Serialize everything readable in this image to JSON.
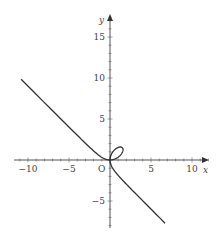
{
  "chart_data": {
    "type": "line",
    "title": "",
    "equation": "x^3 + y^3 = 3xy",
    "parameter_a": 1,
    "xlabel": "x",
    "ylabel": "y",
    "origin_label": "O",
    "xlim": [
      -11.7,
      12
    ],
    "ylim": [
      -8.3,
      17.7
    ],
    "x_ticks": [
      -10,
      -5,
      5,
      10
    ],
    "y_ticks": [
      -5,
      5,
      10,
      15
    ],
    "x_tick_labels": [
      "−10",
      "−5",
      "5",
      "10"
    ],
    "y_tick_labels": [
      "−5",
      "5",
      "10",
      "15"
    ],
    "minor_tick_step": 1,
    "grid": false,
    "legend": null,
    "series": [
      {
        "name": "folium",
        "approx_points": [
          [
            -11.6,
            11.1
          ],
          [
            -5,
            4.2
          ],
          [
            -2,
            1.2
          ],
          [
            -1,
            0.5
          ],
          [
            0,
            0
          ],
          [
            0.5,
            1.3
          ],
          [
            1.5,
            1.5
          ],
          [
            1.3,
            0.5
          ],
          [
            0,
            0
          ],
          [
            0.5,
            -1.2
          ],
          [
            2,
            -2.7
          ],
          [
            7,
            -8.2
          ]
        ]
      }
    ],
    "colors": {
      "curve": "#333333",
      "axis": "#555555",
      "text": "#444444"
    }
  }
}
